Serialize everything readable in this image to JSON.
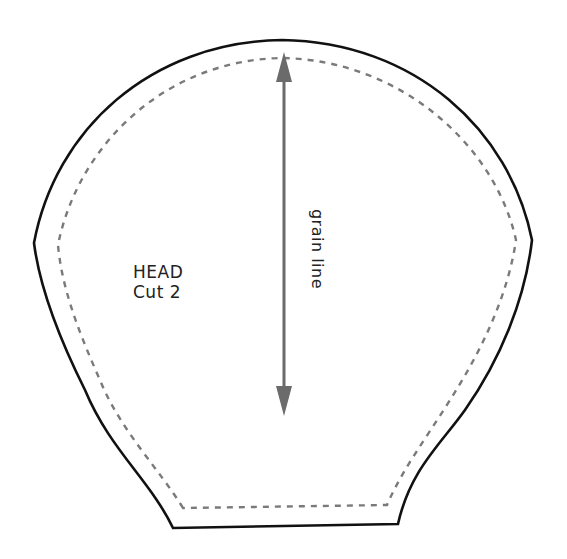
{
  "pattern_piece": {
    "name": "HEAD",
    "instruction": "Cut 2",
    "grain_label": "grain line"
  },
  "colors": {
    "cut_line": "#111111",
    "seam_line": "#7a7a7a",
    "grain_arrow": "#6b6b6b",
    "text": "#222222",
    "background": "#ffffff"
  },
  "lines": {
    "cut_line": {
      "style": "solid",
      "description": "outer cutting line"
    },
    "seam_line": {
      "style": "dashed",
      "description": "inner stitching line (seam allowance)"
    },
    "grain_line": {
      "style": "double-headed arrow",
      "orientation": "vertical"
    }
  }
}
